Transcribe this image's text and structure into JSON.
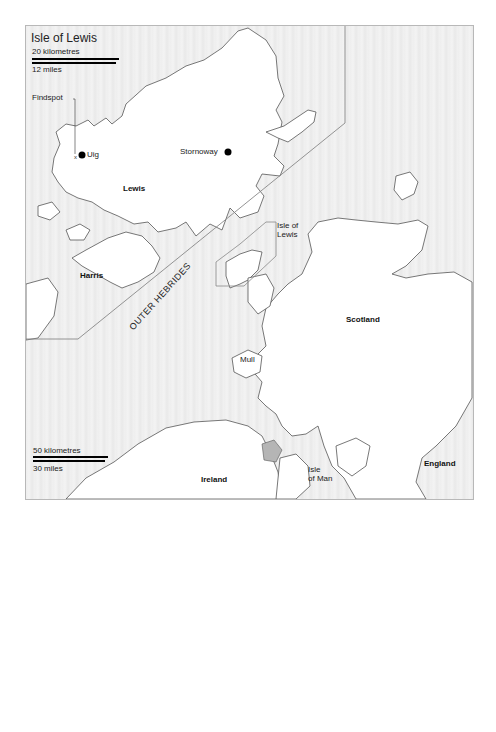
{
  "map": {
    "title": "Isle of Lewis",
    "inset_scale": {
      "km_label": "20 kilometres",
      "mi_label": "12 miles"
    },
    "main_scale": {
      "km_label": "50 kilometres",
      "mi_label": "30 miles"
    },
    "inset_labels": {
      "findspot": "Findspot",
      "uig": "Uig",
      "stornoway": "Stornoway",
      "lewis": "Lewis",
      "harris": "Harris"
    },
    "main_labels": {
      "outer_hebrides": "OUTER HEBRIDES",
      "isle_of_lewis_line1": "Isle of",
      "isle_of_lewis_line2": "Lewis",
      "scotland": "Scotland",
      "mull": "Mull",
      "ireland": "Ireland",
      "isle_of_man_line1": "Isle",
      "isle_of_man_line2": "of Man",
      "england": "England"
    },
    "colors": {
      "sea": "#ececec",
      "land": "#ffffff",
      "coast": "#555555",
      "lake": "#b5b5b5",
      "border": "#999999"
    }
  }
}
